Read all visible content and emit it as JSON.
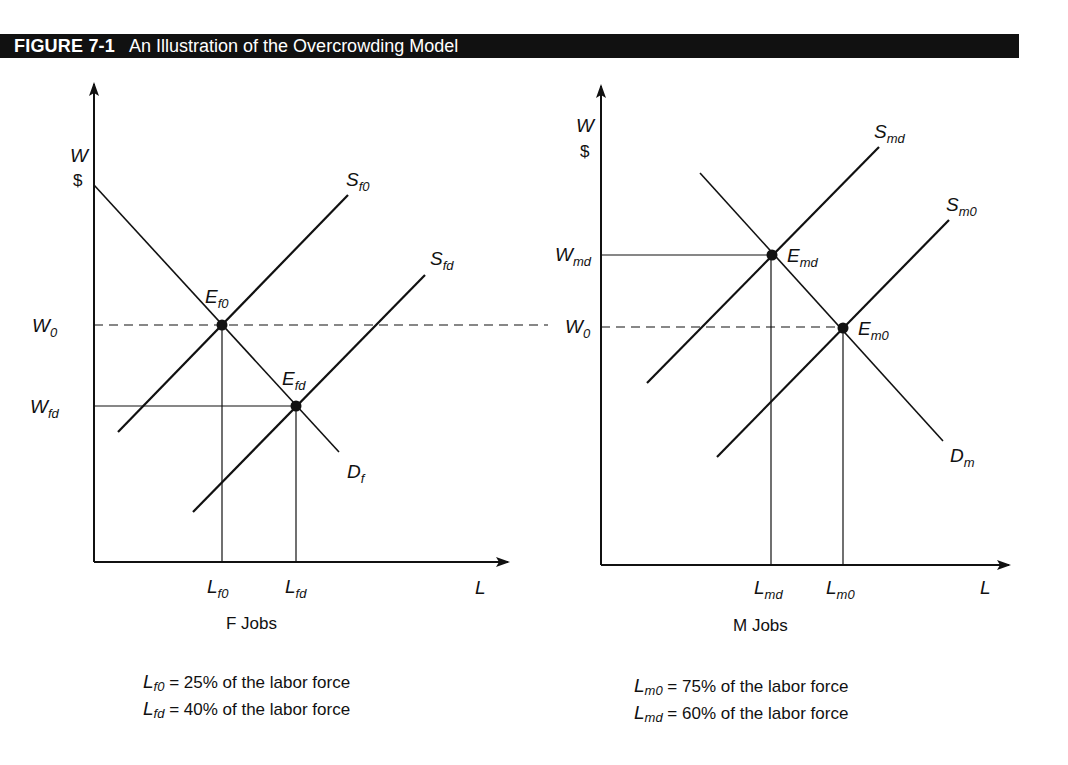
{
  "figure": {
    "number": "FIGURE 7-1",
    "title": "An Illustration of the Overcrowding Model",
    "title_bar_color": "#111111"
  },
  "left_panel": {
    "caption": "F Jobs",
    "y_axis": {
      "label": "W",
      "unit": "$"
    },
    "x_axis": {
      "label": "L"
    },
    "wage_labels": {
      "w0": {
        "base": "W",
        "sub": "0"
      },
      "wfd": {
        "base": "W",
        "sub": "fd"
      }
    },
    "quantity_labels": {
      "lf0": {
        "base": "L",
        "sub": "f0"
      },
      "lfd": {
        "base": "L",
        "sub": "fd"
      }
    },
    "curves": {
      "sf0": {
        "base": "S",
        "sub": "f0"
      },
      "sfd": {
        "base": "S",
        "sub": "fd"
      },
      "df": {
        "base": "D",
        "sub": "f"
      }
    },
    "equilibria": {
      "ef0": {
        "base": "E",
        "sub": "f0"
      },
      "efd": {
        "base": "E",
        "sub": "fd"
      }
    },
    "notes": [
      {
        "base": "L",
        "sub": "f0",
        "text": " = 25% of the labor force"
      },
      {
        "base": "L",
        "sub": "fd",
        "text": " = 40% of the labor force"
      }
    ]
  },
  "right_panel": {
    "caption": "M Jobs",
    "y_axis": {
      "label": "W",
      "unit": "$"
    },
    "x_axis": {
      "label": "L"
    },
    "wage_labels": {
      "w0": {
        "base": "W",
        "sub": "0"
      },
      "wmd": {
        "base": "W",
        "sub": "md"
      }
    },
    "quantity_labels": {
      "lmd": {
        "base": "L",
        "sub": "md"
      },
      "lm0": {
        "base": "L",
        "sub": "m0"
      }
    },
    "curves": {
      "smd": {
        "base": "S",
        "sub": "md"
      },
      "sm0": {
        "base": "S",
        "sub": "m0"
      },
      "dm": {
        "base": "D",
        "sub": "m"
      }
    },
    "equilibria": {
      "emd": {
        "base": "E",
        "sub": "md"
      },
      "em0": {
        "base": "E",
        "sub": "m0"
      }
    },
    "notes": [
      {
        "base": "L",
        "sub": "m0",
        "text": " = 75% of the labor force"
      },
      {
        "base": "L",
        "sub": "md",
        "text": " = 60% of the labor force"
      }
    ]
  }
}
